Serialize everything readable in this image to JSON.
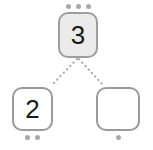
{
  "diagram": {
    "background_color": "#ffffff",
    "accent_color": "#9a9a9a",
    "dot_color": "#a8a8a8",
    "digit_color": "#1a1a1a",
    "selected_fill": "#ebebeb",
    "nodes": [
      {
        "id": "top",
        "role": "parent",
        "value": "3",
        "empty": false,
        "selected": true,
        "dot_count": 3,
        "dot_position": "above"
      },
      {
        "id": "left",
        "role": "child",
        "value": "2",
        "empty": false,
        "selected": false,
        "dot_count": 2,
        "dot_position": "below"
      },
      {
        "id": "right",
        "role": "child",
        "value": "",
        "empty": true,
        "selected": false,
        "dot_count": 1,
        "dot_position": "below"
      }
    ],
    "connectors": [
      {
        "from": "top",
        "to": "left",
        "style": "dotted"
      },
      {
        "from": "top",
        "to": "right",
        "style": "dotted"
      }
    ]
  }
}
